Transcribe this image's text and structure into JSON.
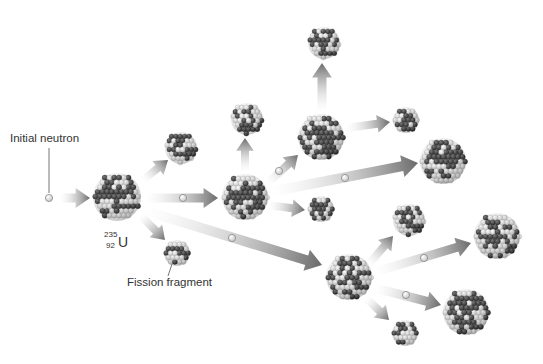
{
  "diagram": {
    "type": "nuclear-fission-chain-reaction",
    "labels": {
      "initial_neutron": "Initial neutron",
      "fission_fragment": "Fission fragment",
      "isotope_symbol": "U",
      "isotope_mass": "235",
      "isotope_atomic_number": "92"
    },
    "colors": {
      "proton_dark": "#3a3a3a",
      "neutron_light": "#f2f2f2",
      "arrow": "#6a6a6a",
      "text": "#333333"
    },
    "nuclei": [
      {
        "id": "u235-primary",
        "cx": 117,
        "cy": 197,
        "r": 24
      },
      {
        "id": "frag-a1",
        "cx": 181,
        "cy": 148,
        "r": 16
      },
      {
        "id": "frag-a2",
        "cx": 177,
        "cy": 253,
        "r": 13
      },
      {
        "id": "u235-gen2",
        "cx": 245,
        "cy": 197,
        "r": 23
      },
      {
        "id": "frag-b1",
        "cx": 247,
        "cy": 119,
        "r": 16
      },
      {
        "id": "frag-b2",
        "cx": 321,
        "cy": 209,
        "r": 13
      },
      {
        "id": "u235-gen2b",
        "cx": 321,
        "cy": 137,
        "r": 23
      },
      {
        "id": "frag-c1",
        "cx": 324,
        "cy": 43,
        "r": 16
      },
      {
        "id": "frag-c2",
        "cx": 406,
        "cy": 120,
        "r": 13
      },
      {
        "id": "u235-gen3a",
        "cx": 443,
        "cy": 161,
        "r": 23
      },
      {
        "id": "u235-gen3b",
        "cx": 349,
        "cy": 277,
        "r": 23
      },
      {
        "id": "frag-d1",
        "cx": 409,
        "cy": 220,
        "r": 16
      },
      {
        "id": "frag-d2",
        "cx": 405,
        "cy": 333,
        "r": 13
      },
      {
        "id": "u235-gen4a",
        "cx": 497,
        "cy": 236,
        "r": 23
      },
      {
        "id": "u235-gen4b",
        "cx": 466,
        "cy": 312,
        "r": 23
      }
    ],
    "arrows": [
      {
        "from": [
          60,
          198
        ],
        "to": [
          90,
          198
        ],
        "w": 9
      },
      {
        "from": [
          143,
          180
        ],
        "to": [
          168,
          160
        ],
        "w": 8
      },
      {
        "from": [
          140,
          215
        ],
        "to": [
          165,
          240
        ],
        "w": 8
      },
      {
        "from": [
          145,
          198
        ],
        "to": [
          218,
          198
        ],
        "w": 9
      },
      {
        "from": [
          143,
          210
        ],
        "to": [
          322,
          265
        ],
        "w": 10
      },
      {
        "from": [
          245,
          172
        ],
        "to": [
          245,
          138
        ],
        "w": 8
      },
      {
        "from": [
          268,
          205
        ],
        "to": [
          305,
          210
        ],
        "w": 8
      },
      {
        "from": [
          268,
          183
        ],
        "to": [
          298,
          155
        ],
        "w": 8
      },
      {
        "from": [
          270,
          192
        ],
        "to": [
          418,
          163
        ],
        "w": 10
      },
      {
        "from": [
          322,
          112
        ],
        "to": [
          322,
          63
        ],
        "w": 9
      },
      {
        "from": [
          346,
          128
        ],
        "to": [
          390,
          122
        ],
        "w": 8
      },
      {
        "from": [
          368,
          265
        ],
        "to": [
          393,
          236
        ],
        "w": 8
      },
      {
        "from": [
          375,
          272
        ],
        "to": [
          471,
          243
        ],
        "w": 9
      },
      {
        "from": [
          375,
          288
        ],
        "to": [
          441,
          305
        ],
        "w": 9
      },
      {
        "from": [
          366,
          298
        ],
        "to": [
          389,
          320
        ],
        "w": 8
      }
    ],
    "neutrons": [
      {
        "cx": 49,
        "cy": 198
      },
      {
        "cx": 183,
        "cy": 198
      },
      {
        "cx": 279,
        "cy": 171
      },
      {
        "cx": 345,
        "cy": 178
      },
      {
        "cx": 232,
        "cy": 238
      },
      {
        "cx": 424,
        "cy": 258
      },
      {
        "cx": 406,
        "cy": 295
      }
    ]
  }
}
